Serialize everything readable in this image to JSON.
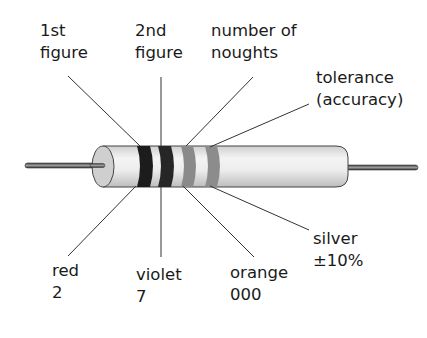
{
  "diagram": {
    "top_labels": [
      {
        "id": "first",
        "line1": "1st",
        "line2": "figure"
      },
      {
        "id": "second",
        "line1": "2nd",
        "line2": "figure"
      },
      {
        "id": "noughts",
        "line1": "number of",
        "line2": "noughts"
      },
      {
        "id": "tolerance",
        "line1": "tolerance",
        "line2": "(accuracy)"
      }
    ],
    "bottom_labels": [
      {
        "id": "red",
        "line1": "red",
        "line2": "2"
      },
      {
        "id": "violet",
        "line1": "violet",
        "line2": "7"
      },
      {
        "id": "orange",
        "line1": "orange",
        "line2": "000"
      },
      {
        "id": "silver",
        "line1": "silver",
        "line2": "±10%"
      }
    ],
    "bands": [
      {
        "name": "band-1-red",
        "color": "#1c1c1c"
      },
      {
        "name": "band-2-violet",
        "color": "#262626"
      },
      {
        "name": "band-3-orange",
        "color": "#8a8a8a"
      },
      {
        "name": "band-4-silver",
        "color": "#8c8c8c"
      }
    ]
  }
}
